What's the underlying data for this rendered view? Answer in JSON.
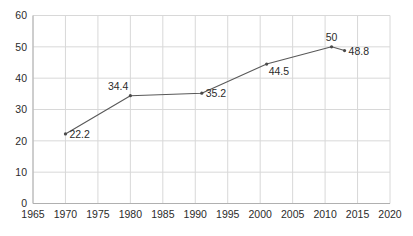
{
  "chart_data": {
    "type": "line",
    "title": "",
    "subtitle": "",
    "xlabel": "",
    "ylabel": "",
    "xlim": [
      1965,
      2020
    ],
    "ylim": [
      0,
      60
    ],
    "grid": true,
    "legend": false,
    "legend_position": "none",
    "x_ticks": [
      1965,
      1970,
      1975,
      1980,
      1985,
      1990,
      1995,
      2000,
      2005,
      2010,
      2015,
      2020
    ],
    "y_ticks": [
      0,
      10,
      20,
      30,
      40,
      50,
      60
    ],
    "x": [
      1970,
      1980,
      1991,
      2001,
      2011,
      2013
    ],
    "values": [
      22.2,
      34.4,
      35.2,
      44.5,
      50,
      48.8
    ],
    "point_labels": [
      "22.2",
      "34.4",
      "35.2",
      "44.5",
      "50",
      "48.8"
    ],
    "series": [
      {
        "name": "",
        "points": [
          {
            "x": 1970,
            "y": 22.2,
            "label": "22.2",
            "label_pos": "right"
          },
          {
            "x": 1980,
            "y": 34.4,
            "label": "34.4",
            "label_pos": "above-left"
          },
          {
            "x": 1991,
            "y": 35.2,
            "label": "35.2",
            "label_pos": "right"
          },
          {
            "x": 2001,
            "y": 44.5,
            "label": "44.5",
            "label_pos": "below-right"
          },
          {
            "x": 2011,
            "y": 50,
            "label": "50",
            "label_pos": "above"
          },
          {
            "x": 2013,
            "y": 48.8,
            "label": "48.8",
            "label_pos": "right"
          }
        ]
      }
    ],
    "colors": {
      "line": "#595959",
      "marker": "#4a4a4a",
      "grid": "#d8d8d8",
      "axis": "#b0b0b0",
      "text": "#2b2b2b",
      "background": "#ffffff"
    }
  }
}
